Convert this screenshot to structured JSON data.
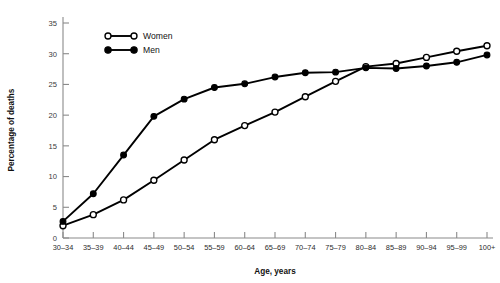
{
  "chart_data": {
    "type": "line",
    "title": "",
    "xlabel": "Age, years",
    "ylabel": "Percentage of deaths",
    "categories": [
      "30–34",
      "35–39",
      "40–44",
      "45–49",
      "50–54",
      "55–59",
      "60–64",
      "65–69",
      "70–74",
      "75–79",
      "80–84",
      "85–89",
      "90–94",
      "95–99",
      "100+"
    ],
    "series": [
      {
        "name": "Women",
        "marker": "open-circle",
        "values": [
          2.0,
          3.8,
          6.2,
          9.4,
          12.7,
          16.0,
          18.3,
          20.5,
          23.0,
          25.5,
          27.9,
          28.4,
          29.4,
          30.4,
          31.3
        ]
      },
      {
        "name": "Men",
        "marker": "filled-circle",
        "values": [
          2.7,
          7.2,
          13.5,
          19.8,
          22.6,
          24.5,
          25.1,
          26.2,
          26.9,
          27.0,
          27.7,
          27.6,
          28.0,
          28.6,
          29.8
        ]
      }
    ],
    "ylim": [
      0,
      36
    ],
    "yticks": [
      0,
      5,
      10,
      15,
      20,
      25,
      30,
      35
    ],
    "ytick_labels": [
      "0",
      "5",
      "10",
      "15",
      "20",
      "25",
      "30",
      "35"
    ],
    "grid": false,
    "legend_position": "top-left-inside",
    "line_color": "#000000",
    "axis_color": "#8a8a8a"
  },
  "legend": {
    "entries": [
      {
        "label": "Women"
      },
      {
        "label": "Men"
      }
    ]
  }
}
